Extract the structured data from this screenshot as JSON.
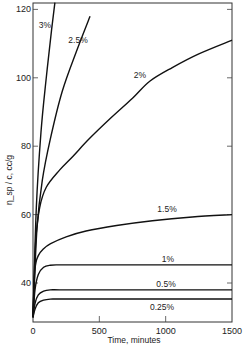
{
  "chart_data": {
    "type": "line",
    "title": "",
    "xlabel": "Time, minutes",
    "ylabel": "η_sp / c, cc/g",
    "xlim": [
      0,
      1500
    ],
    "ylim": [
      28.6,
      122
    ],
    "x_ticks": [
      0,
      500,
      1000,
      1500
    ],
    "y_ticks": [
      40,
      60,
      80,
      100,
      120
    ],
    "grid": false,
    "legend": "inline curve labels",
    "series": [
      {
        "name": "3%",
        "x": [
          0,
          25,
          60,
          100,
          140,
          165
        ],
        "values": [
          30,
          62,
          84,
          100,
          114,
          122
        ],
        "label_pos": [
          45,
          28
        ]
      },
      {
        "name": "2.5%",
        "x": [
          0,
          30,
          70,
          130,
          220,
          330,
          430
        ],
        "values": [
          30,
          56,
          70,
          82,
          96,
          108,
          118
        ],
        "label_pos": [
          78,
          43
        ]
      },
      {
        "name": "2%",
        "x": [
          0,
          20,
          50,
          100,
          200,
          300,
          420,
          580,
          750,
          880,
          1050,
          1250,
          1500
        ],
        "values": [
          30,
          52,
          62,
          68,
          73,
          77,
          82,
          88,
          94,
          99,
          103,
          107,
          111
        ],
        "label_pos": [
          140,
          78
        ]
      },
      {
        "name": "1.5%",
        "x": [
          0,
          15,
          40,
          80,
          133,
          250,
          400,
          630,
          900,
          1200,
          1500
        ],
        "values": [
          30,
          44,
          48,
          50,
          51.5,
          53.5,
          55.2,
          56.8,
          58.2,
          59.3,
          60
        ],
        "label_pos": [
          167,
          212
        ]
      },
      {
        "name": "1%",
        "x": [
          0,
          15,
          40,
          80,
          130,
          200,
          400,
          800,
          1500
        ],
        "values": [
          30,
          38,
          42.5,
          44.6,
          45.2,
          45.3,
          45.3,
          45.3,
          45.3
        ],
        "label_pos": [
          168,
          262
        ]
      },
      {
        "name": "0.5%",
        "x": [
          0,
          15,
          40,
          80,
          130,
          200,
          400,
          800,
          1500
        ],
        "values": [
          30,
          34,
          36.5,
          37.6,
          38,
          38,
          38,
          38,
          38
        ],
        "label_pos": [
          166,
          287
        ]
      },
      {
        "name": "0.25%",
        "x": [
          0,
          15,
          40,
          80,
          130,
          200,
          400,
          800,
          1500
        ],
        "values": [
          30,
          32.3,
          34.2,
          35.0,
          35.3,
          35.3,
          35.3,
          35.3,
          35.3
        ],
        "label_pos": [
          162,
          310
        ]
      }
    ]
  },
  "axes": {
    "x_title": "Time, minutes",
    "y_title": "η_sp / c, cc/g",
    "x_tick_labels": [
      "0",
      "500",
      "1000",
      "1500"
    ],
    "y_tick_labels": [
      "40",
      "60",
      "80",
      "100",
      "120"
    ]
  }
}
